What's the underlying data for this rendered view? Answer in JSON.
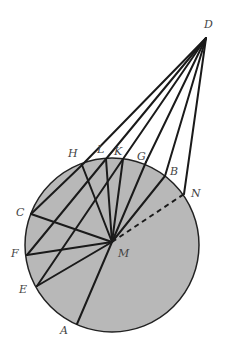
{
  "diagram": {
    "title": "",
    "circle": {
      "cx": 112,
      "cy": 245,
      "r": 87,
      "fill": "#b8b8b8",
      "stroke": "#222222"
    },
    "points": {
      "D": {
        "x": 206,
        "y": 38,
        "label": "D",
        "lx": 204,
        "ly": 28
      },
      "M": {
        "x": 112,
        "y": 242,
        "label": "M",
        "lx": 118,
        "ly": 257
      },
      "H": {
        "x": 82,
        "y": 165,
        "label": "H",
        "lx": 68,
        "ly": 157
      },
      "L": {
        "x": 106,
        "y": 159,
        "label": "L",
        "lx": 97,
        "ly": 153
      },
      "K": {
        "x": 123,
        "y": 159,
        "label": "K",
        "lx": 114,
        "ly": 155
      },
      "G": {
        "x": 146,
        "y": 162,
        "label": "G",
        "lx": 137,
        "ly": 160
      },
      "B": {
        "x": 165,
        "y": 176,
        "label": "B",
        "lx": 170,
        "ly": 175
      },
      "N": {
        "x": 184,
        "y": 194,
        "label": "N",
        "lx": 191,
        "ly": 197
      },
      "C": {
        "x": 31,
        "y": 214,
        "label": "C",
        "lx": 16,
        "ly": 216
      },
      "F": {
        "x": 27,
        "y": 255,
        "label": "F",
        "lx": 11,
        "ly": 257
      },
      "E": {
        "x": 37,
        "y": 286,
        "label": "E",
        "lx": 19,
        "ly": 293
      },
      "A": {
        "x": 77,
        "y": 324,
        "label": "A",
        "lx": 60,
        "ly": 334
      }
    },
    "solid_lines": [
      [
        "D",
        "H"
      ],
      [
        "D",
        "L"
      ],
      [
        "D",
        "K"
      ],
      [
        "D",
        "G"
      ],
      [
        "D",
        "B"
      ],
      [
        "D",
        "N"
      ],
      [
        "H",
        "C"
      ],
      [
        "L",
        "F"
      ],
      [
        "K",
        "E"
      ],
      [
        "H",
        "M"
      ],
      [
        "L",
        "M"
      ],
      [
        "K",
        "M"
      ],
      [
        "G",
        "M"
      ],
      [
        "B",
        "M"
      ],
      [
        "C",
        "M"
      ],
      [
        "F",
        "M"
      ],
      [
        "E",
        "M"
      ],
      [
        "A",
        "M"
      ]
    ],
    "dashed_lines": [
      [
        "M",
        "N"
      ]
    ]
  }
}
